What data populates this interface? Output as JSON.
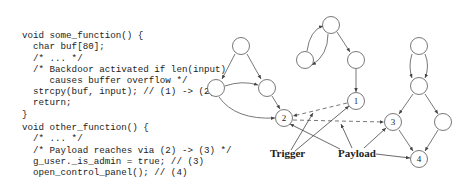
{
  "code": {
    "block1": [
      "void some_function() {",
      "  char buf[80];",
      "  /* ... */",
      "  /* Backdoor activated if len(input)",
      "     causes buffer overflow */",
      "  strcpy(buf, input); // (1) -> (2)",
      "  return;",
      "}"
    ],
    "block2": [
      "void other_function() {",
      "  /* ... */",
      "  /* Payload reaches via (2) -> (3) */",
      "  g_user._is_admin = true; // (3)",
      "  open_control_panel(); // (4)",
      "}"
    ]
  },
  "graph": {
    "nodes": [
      {
        "id": "a",
        "x": 241,
        "y": 46,
        "label": ""
      },
      {
        "id": "b",
        "x": 216,
        "y": 88,
        "label": ""
      },
      {
        "id": "c",
        "x": 267,
        "y": 88,
        "label": ""
      },
      {
        "id": "n2",
        "x": 284,
        "y": 118,
        "label": "2"
      },
      {
        "id": "d",
        "x": 331,
        "y": 25,
        "label": ""
      },
      {
        "id": "e",
        "x": 305,
        "y": 60,
        "label": ""
      },
      {
        "id": "f",
        "x": 356,
        "y": 60,
        "label": ""
      },
      {
        "id": "n1",
        "x": 356,
        "y": 101,
        "label": "1"
      },
      {
        "id": "g",
        "x": 419,
        "y": 46,
        "label": ""
      },
      {
        "id": "h",
        "x": 419,
        "y": 86,
        "label": ""
      },
      {
        "id": "n3",
        "x": 393,
        "y": 122,
        "label": "3"
      },
      {
        "id": "i",
        "x": 443,
        "y": 122,
        "label": ""
      },
      {
        "id": "n4",
        "x": 419,
        "y": 159,
        "label": "4"
      }
    ],
    "labels": {
      "trigger": "Trigger",
      "payload": "Payload"
    }
  }
}
